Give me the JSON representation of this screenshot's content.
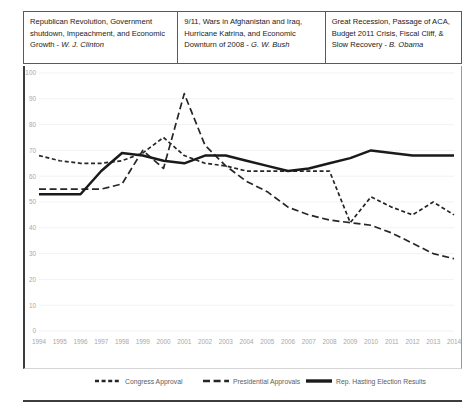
{
  "headers": [
    {
      "id": "clinton",
      "text": "Republican Revolution, Government shutdown, Impeachment, and Economic Growth - ",
      "president": "W. J. Clinton"
    },
    {
      "id": "bush",
      "text": "9/11, Wars in Afghanistan and Iraq, Hurricane Katrina, and Economic Downturn of 2008 - ",
      "president": "G. W. Bush"
    },
    {
      "id": "obama",
      "text": "Great Recession, Passage of ACA, Budget 2011 Crisis, Fiscal Cliff, & Slow Recovery - ",
      "president": "B. Obama"
    }
  ],
  "chart_data": {
    "type": "line",
    "title": "",
    "xlabel": "",
    "ylabel": "",
    "ylim": [
      0,
      100
    ],
    "ytick_step": 10,
    "grid": true,
    "legend_position": "bottom",
    "categories": [
      "1994",
      "1995",
      "1996",
      "1997",
      "1998",
      "1999",
      "2000",
      "2001",
      "2002",
      "2003",
      "2004",
      "2005",
      "2006",
      "2007",
      "2008",
      "2009",
      "2010",
      "2011",
      "2012",
      "2013",
      "2014"
    ],
    "yticks": [
      0,
      10,
      20,
      30,
      40,
      50,
      60,
      70,
      80,
      90,
      100
    ],
    "series": [
      {
        "name": "Congress Approval",
        "style": "short-dash",
        "color": "#262626",
        "values": [
          68,
          66,
          65,
          65,
          66,
          69,
          75,
          68,
          65,
          64,
          62,
          62,
          62,
          62,
          62,
          42,
          52,
          48,
          45,
          50,
          45
        ]
      },
      {
        "name": "Presidential Approvals",
        "style": "long-dash",
        "color": "#262626",
        "values": [
          55,
          55,
          55,
          55,
          57,
          70,
          63,
          92,
          72,
          64,
          58,
          54,
          48,
          45,
          43,
          42,
          41,
          38,
          34,
          30,
          28
        ]
      },
      {
        "name": "Rep. Hasting Election Results",
        "style": "solid",
        "color": "#1a1a1a",
        "values": [
          53,
          53,
          53,
          62,
          69,
          68,
          66,
          65,
          68,
          68,
          66,
          64,
          62,
          63,
          65,
          67,
          70,
          69,
          68,
          68,
          68
        ]
      }
    ]
  }
}
